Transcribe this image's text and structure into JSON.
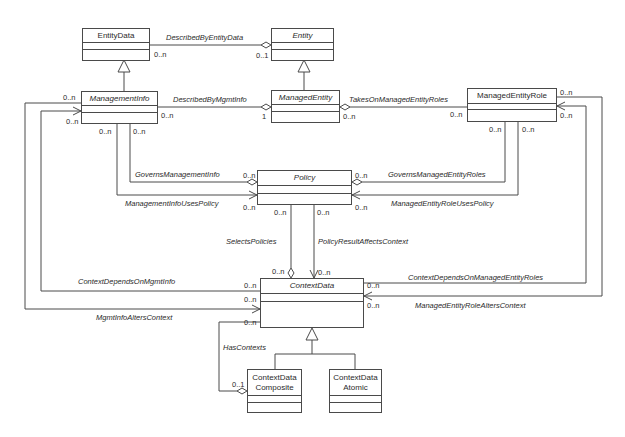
{
  "classes": {
    "entity_data": {
      "name": "EntityData"
    },
    "entity": {
      "name": "Entity"
    },
    "management_info": {
      "name": "ManagementInfo"
    },
    "managed_entity": {
      "name": "ManagedEntity"
    },
    "managed_entity_role": {
      "name": "ManagedEntityRole"
    },
    "policy": {
      "name": "Policy"
    },
    "context_data": {
      "name": "ContextData"
    },
    "context_data_composite": {
      "name": "ContextData Composite"
    },
    "context_data_atomic": {
      "name": "ContextData Atomic"
    }
  },
  "associations": {
    "described_by_entity_data": "DescribedByEntityData",
    "described_by_mgmt_info": "DescribedByMgmtInfo",
    "takes_on_managed_entity_roles": "TakesOnManagedEntityRoles",
    "governs_management_info": "GovernsManagementInfo",
    "management_info_uses_policy": "ManagementInfoUsesPolicy",
    "governs_managed_entity_roles": "GovernsManagedEntityRoles",
    "managed_entity_role_uses_policy": "ManagedEntityRoleUsesPolicy",
    "selects_policies": "SelectsPolicies",
    "policy_result_affects_context": "PolicyResultAffectsContext",
    "context_depends_on_mgmt_info": "ContextDependsOnMgmtInfo",
    "mgmt_info_alters_context": "MgmtInfoAltersContext",
    "context_depends_on_managed_entity_roles": "ContextDependsOnManagedEntityRoles",
    "managed_entity_role_alters_context": "ManagedEntityRoleAltersContext",
    "has_contexts": "HasContexts"
  },
  "multiplicities": {
    "m_0n": "0..n",
    "m_01": "0..1",
    "m_1": "1"
  }
}
